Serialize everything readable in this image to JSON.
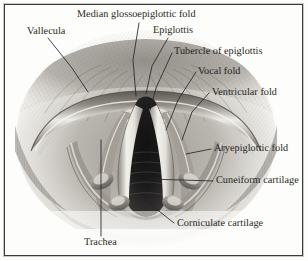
{
  "figure": {
    "kind": "anatomical-illustration",
    "view_title": "Laryngoscopic view of the larynx",
    "border_color": "#3b3b3d",
    "background_color": "#fdfdfb",
    "ink_color": "#1d1d20"
  },
  "labels": [
    {
      "id": "median-glossoepiglottic-fold",
      "text": "Median glossoepiglottic fold"
    },
    {
      "id": "vallecula",
      "text": "Vallecula"
    },
    {
      "id": "epiglottis",
      "text": "Epiglottis"
    },
    {
      "id": "tubercle-of-epiglottis",
      "text": "Tubercle of epiglottis"
    },
    {
      "id": "vocal-fold",
      "text": "Vocal fold"
    },
    {
      "id": "ventricular-fold",
      "text": "Ventricular fold"
    },
    {
      "id": "aryepiglottic-fold",
      "text": "Aryepiglottic fold"
    },
    {
      "id": "cuneiform-cartilage",
      "text": "Cuneiform cartilage"
    },
    {
      "id": "corniculate-cartilage",
      "text": "Corniculate cartilage"
    },
    {
      "id": "trachea",
      "text": "Trachea"
    }
  ]
}
